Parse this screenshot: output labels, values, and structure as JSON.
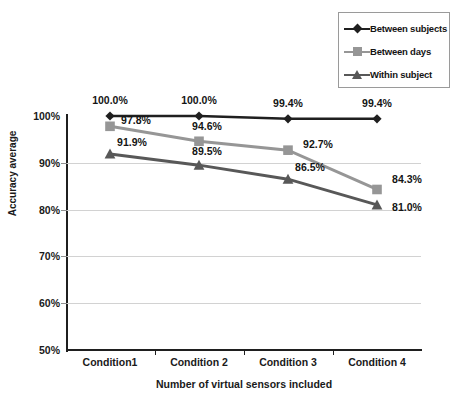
{
  "chart_data": {
    "type": "line",
    "title": "",
    "xlabel": "Number of virtual sensors included",
    "ylabel": "Accuracy average",
    "categories": [
      "Condition1",
      "Condition 2",
      "Condition 3",
      "Condition 4"
    ],
    "ylim": [
      50,
      100
    ],
    "yticks": [
      50,
      60,
      70,
      80,
      90,
      100
    ],
    "ytick_labels": [
      "50%",
      "60%",
      "70%",
      "80%",
      "90%",
      "100%"
    ],
    "grid": true,
    "legend_position": "top-right",
    "series": [
      {
        "name": "Between subjects",
        "marker": "diamond",
        "color": "#1f1f1f",
        "values": [
          100.0,
          100.0,
          99.4,
          99.4
        ],
        "labels": [
          "100.0%",
          "100.0%",
          "99.4%",
          "99.4%"
        ]
      },
      {
        "name": "Between days",
        "marker": "square",
        "color": "#969696",
        "values": [
          97.8,
          94.6,
          92.7,
          84.3
        ],
        "labels": [
          "97.8%",
          "94.6%",
          "92.7%",
          "84.3%"
        ]
      },
      {
        "name": "Within subject",
        "marker": "triangle",
        "color": "#585858",
        "values": [
          91.9,
          89.5,
          86.5,
          81.0
        ],
        "labels": [
          "91.9%",
          "89.5%",
          "86.5%",
          "81.0%"
        ]
      }
    ]
  },
  "legend": {
    "items": [
      {
        "label": "Between subjects"
      },
      {
        "label": "Between days"
      },
      {
        "label": "Within subject"
      }
    ]
  },
  "axes": {
    "y_title": "Accuracy average",
    "x_title": "Number of virtual sensors included",
    "y_tick_0": "50%",
    "y_tick_1": "60%",
    "y_tick_2": "70%",
    "y_tick_3": "80%",
    "y_tick_4": "90%",
    "y_tick_5": "100%",
    "x_tick_0": "Condition1",
    "x_tick_1": "Condition 2",
    "x_tick_2": "Condition 3",
    "x_tick_3": "Condition 4"
  },
  "colors": {
    "series_between_subjects": "#1f1f1f",
    "series_between_days": "#969696",
    "series_within_subject": "#585858",
    "gridline": "#d2d2d2",
    "axis": "#1f1f1f",
    "background": "#ffffff"
  }
}
